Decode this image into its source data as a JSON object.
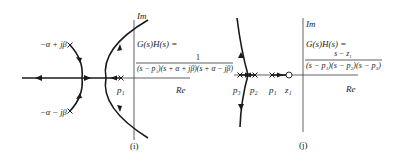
{
  "figure_i": {
    "caption": "(i)",
    "axes": {
      "imag_label": "Im",
      "real_label": "Re"
    },
    "formula": {
      "lhs": "G(s)H(s) =",
      "numerator": "1",
      "denominator": "(s − p₁)(s + α + jβ)(s + α − jβ)"
    },
    "poles": [
      {
        "label": "p₁",
        "type": "pole"
      },
      {
        "label": "−α + jβ",
        "type": "pole"
      },
      {
        "label": "−α − jβ",
        "type": "pole"
      }
    ]
  },
  "figure_j": {
    "caption": "(j)",
    "axes": {
      "imag_label": "Im",
      "real_label": "Re"
    },
    "formula": {
      "lhs": "G(s)H(s) =",
      "numerator": "s − z₁",
      "denominator": "(s − p₁)(s − p₂)(s − p₃)"
    },
    "poles": [
      {
        "label": "p₃",
        "type": "pole"
      },
      {
        "label": "p₂",
        "type": "pole"
      },
      {
        "label": "p₁",
        "type": "pole"
      }
    ],
    "zeros": [
      {
        "label": "z₁",
        "type": "zero"
      }
    ]
  },
  "colors": {
    "ink": "#1a1a1a",
    "axis": "#3a3a3a",
    "background": "#ffffff"
  }
}
